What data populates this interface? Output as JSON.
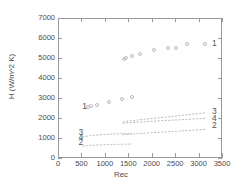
{
  "chart_data": {
    "type": "scatter",
    "title": "",
    "xlabel": "Rec",
    "ylabel": "H (W/m^2 K)",
    "xlim": [
      0,
      3500
    ],
    "ylim": [
      0,
      7000
    ],
    "xticks": [
      0,
      500,
      1000,
      1500,
      2000,
      2500,
      3000,
      3500
    ],
    "yticks": [
      0,
      1000,
      2000,
      3000,
      4000,
      5000,
      6000,
      7000
    ],
    "grid": false,
    "legend_position": "inline-curve-labels",
    "series": [
      {
        "name": "1",
        "label": "1",
        "style": "circles",
        "color": "#b9b9b9",
        "points": [
          [
            640,
            2530
          ],
          [
            700,
            2600
          ],
          [
            840,
            2640
          ],
          [
            1080,
            2800
          ],
          [
            1370,
            2930
          ],
          [
            1580,
            3040
          ],
          [
            1400,
            4950
          ],
          [
            1450,
            4980
          ],
          [
            1580,
            5090
          ],
          [
            1750,
            5210
          ],
          [
            2050,
            5400
          ],
          [
            2350,
            5520
          ],
          [
            2520,
            5500
          ],
          [
            2760,
            5680
          ],
          [
            3130,
            5720
          ]
        ]
      },
      {
        "name": "3",
        "label": "3",
        "style": "line",
        "color": "#a8a8a8",
        "points": [
          [
            1380,
            1810
          ],
          [
            1700,
            1900
          ],
          [
            2100,
            2000
          ],
          [
            2500,
            2090
          ],
          [
            2900,
            2200
          ],
          [
            3160,
            2270
          ]
        ]
      },
      {
        "name": "4",
        "label": "4",
        "style": "line",
        "color": "#a8a8a8",
        "points": [
          [
            1380,
            1740
          ],
          [
            1700,
            1790
          ],
          [
            2100,
            1850
          ],
          [
            2500,
            1900
          ],
          [
            2900,
            1950
          ],
          [
            3160,
            1990
          ]
        ]
      },
      {
        "name": "3b",
        "label": "3",
        "style": "line",
        "color": "#a8a8a8",
        "points": [
          [
            520,
            1050
          ],
          [
            700,
            1120
          ],
          [
            900,
            1160
          ],
          [
            1150,
            1200
          ],
          [
            1400,
            1220
          ],
          [
            1580,
            1230
          ]
        ]
      },
      {
        "name": "2",
        "label": "2",
        "style": "line",
        "color": "#a8a8a8",
        "points": [
          [
            1380,
            1160
          ],
          [
            1700,
            1220
          ],
          [
            2100,
            1280
          ],
          [
            2500,
            1330
          ],
          [
            2900,
            1390
          ],
          [
            3160,
            1430
          ]
        ]
      },
      {
        "name": "2b",
        "label": "2",
        "style": "line",
        "color": "#a8a8a8",
        "points": [
          [
            520,
            590
          ],
          [
            700,
            630
          ],
          [
            900,
            655
          ],
          [
            1150,
            675
          ],
          [
            1400,
            690
          ],
          [
            1580,
            700
          ]
        ]
      }
    ],
    "curve_labels_left": [
      {
        "text": "1",
        "x": 560,
        "y": 2530
      },
      {
        "text": "3",
        "x": 480,
        "y": 1240
      },
      {
        "text": "4",
        "x": 480,
        "y": 1020
      },
      {
        "text": "2",
        "x": 480,
        "y": 760
      }
    ],
    "curve_labels_right": [
      {
        "text": "1",
        "x": 3330,
        "y": 5700
      },
      {
        "text": "3",
        "x": 3330,
        "y": 2290
      },
      {
        "text": "4",
        "x": 3330,
        "y": 1960
      },
      {
        "text": "2",
        "x": 3330,
        "y": 1610
      }
    ]
  }
}
